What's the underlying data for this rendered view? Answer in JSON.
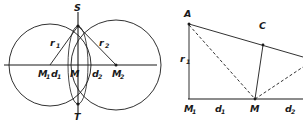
{
  "figure": {
    "background_color": "#ffffff",
    "stroke_color": "#1a1a1a",
    "width": 303,
    "height": 123,
    "left_diagram": {
      "name": "two-intersecting-circles-diagram",
      "labels": {
        "apex_top": "S",
        "apex_bottom": "T",
        "center_left": "M",
        "center_left_sub": "1",
        "dist_left": "d",
        "dist_left_sub": "1",
        "center_mid": "M",
        "dist_right": "d",
        "dist_right_sub": "2",
        "center_right": "M",
        "center_right_sub": "2",
        "radius_left": "r",
        "radius_left_sub": "1",
        "radius_right": "r",
        "radius_right_sub": "2"
      }
    },
    "right_diagram": {
      "name": "triangle-construction-diagram",
      "labels": {
        "vertex_a": "A",
        "vertex_c": "C",
        "radius_left": "r",
        "radius_left_sub": "1",
        "base_left": "M",
        "base_left_sub": "1",
        "dist_left": "d",
        "dist_left_sub": "1",
        "base_mid": "M",
        "dist_right": "d",
        "dist_right_sub": "2"
      }
    }
  }
}
